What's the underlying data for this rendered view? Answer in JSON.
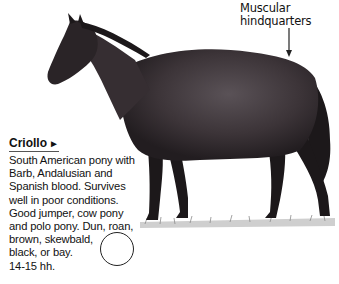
{
  "callout": {
    "line1": "Muscular",
    "line2": "hindquarters"
  },
  "breed": {
    "name": "Criollo",
    "arrow": "►",
    "description_lines": [
      "South American pony with",
      "Barb, Andalusian and",
      "Spanish blood. Survives",
      "well in poor conditions.",
      "Good jumper, cow pony",
      "and polo pony. Dun, roan,",
      "brown, skewbald,",
      "black, or bay.",
      "14-15 hh."
    ]
  },
  "colors": {
    "horse_body": "#3a3236",
    "horse_dark": "#1c181a",
    "text": "#111111"
  }
}
